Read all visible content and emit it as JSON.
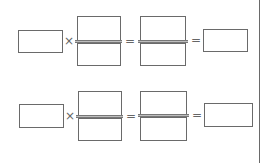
{
  "worksheet": {
    "rows": [
      {
        "operator_multiply": "×",
        "operator_equals_1": "=",
        "operator_equals_2": "=",
        "left_box_value": "",
        "fraction_1": {
          "numerator": "",
          "denominator": ""
        },
        "fraction_2": {
          "numerator": "",
          "denominator": ""
        },
        "result_box_value": ""
      },
      {
        "operator_multiply": "×",
        "operator_equals_1": "=",
        "operator_equals_2": "=",
        "left_box_value": "",
        "fraction_1": {
          "numerator": "",
          "denominator": ""
        },
        "fraction_2": {
          "numerator": "",
          "denominator": ""
        },
        "result_box_value": ""
      }
    ]
  }
}
